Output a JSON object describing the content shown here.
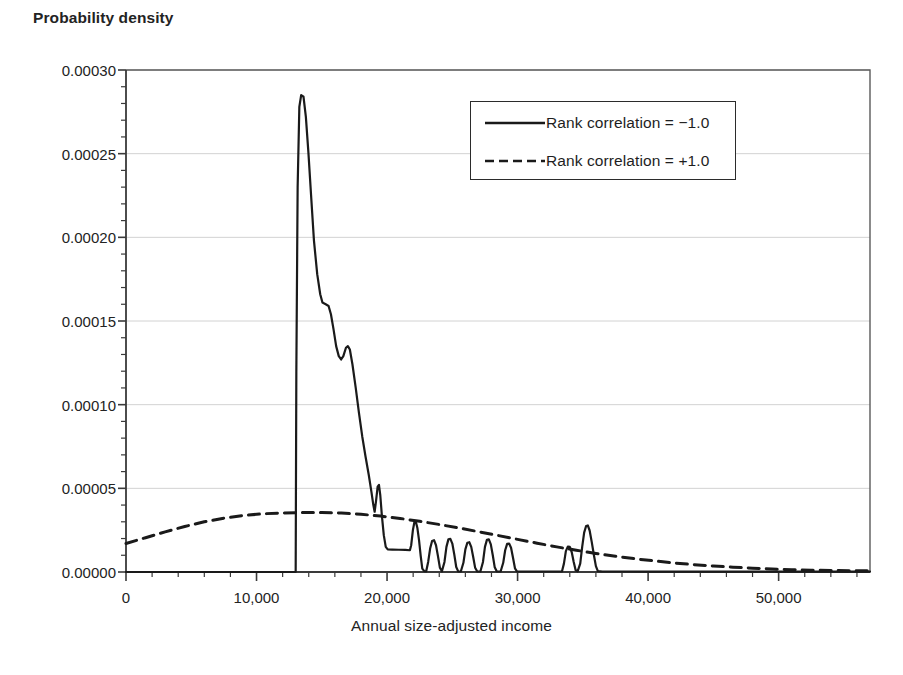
{
  "chart_data": {
    "type": "line",
    "title": "",
    "ylabel": "Probability density",
    "xlabel": "Annual size-adjusted income",
    "xlim": [
      0,
      57000
    ],
    "ylim": [
      0,
      0.0003
    ],
    "grid": "horizontal",
    "legend_position": "top-right",
    "x_ticks": [
      0,
      10000,
      20000,
      30000,
      40000,
      50000
    ],
    "x_tick_labels": [
      "0",
      "10,000",
      "20,000",
      "30,000",
      "40,000",
      "50,000"
    ],
    "x_minor_tick_step": 2000,
    "y_ticks": [
      0.0,
      5e-05,
      0.0001,
      0.00015,
      0.0002,
      0.00025,
      0.0003
    ],
    "y_tick_labels": [
      "0.00000",
      "0.00005",
      "0.00010",
      "0.00015",
      "0.00020",
      "0.00025",
      "0.00030"
    ],
    "y_minor_tick_step": 1e-05,
    "series": [
      {
        "name": "Rank correlation = −1.0",
        "style": "solid",
        "color": "#1a1a1a",
        "points": [
          [
            0,
            0.0
          ],
          [
            12900,
            0.0
          ],
          [
            13000,
            0.0
          ],
          [
            13050,
            0.00012
          ],
          [
            13150,
            0.00023
          ],
          [
            13280,
            0.000278
          ],
          [
            13420,
            0.000285
          ],
          [
            13600,
            0.000284
          ],
          [
            13780,
            0.000272
          ],
          [
            13980,
            0.00025
          ],
          [
            14180,
            0.000225
          ],
          [
            14400,
            0.000198
          ],
          [
            14650,
            0.000178
          ],
          [
            14880,
            0.000166
          ],
          [
            15050,
            0.000161
          ],
          [
            15300,
            0.00016
          ],
          [
            15520,
            0.000159
          ],
          [
            15700,
            0.000154
          ],
          [
            15900,
            0.000145
          ],
          [
            16100,
            0.000135
          ],
          [
            16300,
            0.000129
          ],
          [
            16480,
            0.000127
          ],
          [
            16650,
            0.000129
          ],
          [
            16850,
            0.000134
          ],
          [
            17000,
            0.000135
          ],
          [
            17150,
            0.000133
          ],
          [
            17350,
            0.000124
          ],
          [
            17600,
            0.00011
          ],
          [
            17850,
            9.5e-05
          ],
          [
            18100,
            8.1e-05
          ],
          [
            18350,
            6.9e-05
          ],
          [
            18600,
            5.8e-05
          ],
          [
            18800,
            4.8e-05
          ],
          [
            18950,
            4e-05
          ],
          [
            19050,
            3.6e-05
          ],
          [
            19150,
            4.2e-05
          ],
          [
            19280,
            5.1e-05
          ],
          [
            19380,
            5.2e-05
          ],
          [
            19480,
            4.6e-05
          ],
          [
            19600,
            3.4e-05
          ],
          [
            19750,
            2.2e-05
          ],
          [
            19900,
            1.5e-05
          ],
          [
            20050,
            1.35e-05
          ],
          [
            20400,
            1.34e-05
          ],
          [
            20900,
            1.33e-05
          ],
          [
            21400,
            1.32e-05
          ],
          [
            21750,
            1.3e-05
          ],
          [
            21850,
            1.6e-05
          ],
          [
            21980,
            2.5e-05
          ],
          [
            22100,
            3e-05
          ],
          [
            22200,
            3.02e-05
          ],
          [
            22320,
            2.65e-05
          ],
          [
            22450,
            1.9e-05
          ],
          [
            22580,
            9.5e-06
          ],
          [
            22700,
            2e-06
          ],
          [
            22850,
            5e-07
          ],
          [
            23000,
            4e-07
          ],
          [
            23150,
            6e-06
          ],
          [
            23300,
            1.4e-05
          ],
          [
            23450,
            1.85e-05
          ],
          [
            23600,
            1.9e-05
          ],
          [
            23750,
            1.6e-05
          ],
          [
            23900,
            9.5e-06
          ],
          [
            24050,
            2.5e-06
          ],
          [
            24200,
            4e-07
          ],
          [
            24400,
            6e-06
          ],
          [
            24550,
            1.5e-05
          ],
          [
            24700,
            1.95e-05
          ],
          [
            24850,
            1.98e-05
          ],
          [
            25000,
            1.7e-05
          ],
          [
            25150,
            1.05e-05
          ],
          [
            25300,
            3e-06
          ],
          [
            25450,
            4e-07
          ],
          [
            25650,
            3e-07
          ],
          [
            25850,
            5.5e-06
          ],
          [
            26000,
            1.35e-05
          ],
          [
            26150,
            1.75e-05
          ],
          [
            26300,
            1.78e-05
          ],
          [
            26450,
            1.5e-05
          ],
          [
            26600,
            9e-06
          ],
          [
            26750,
            2.5e-06
          ],
          [
            26900,
            4e-07
          ],
          [
            27150,
            3e-07
          ],
          [
            27350,
            6e-06
          ],
          [
            27500,
            1.5e-05
          ],
          [
            27650,
            1.92e-05
          ],
          [
            27800,
            1.95e-05
          ],
          [
            27950,
            1.65e-05
          ],
          [
            28100,
            1e-05
          ],
          [
            28250,
            2.8e-06
          ],
          [
            28400,
            4e-07
          ],
          [
            28700,
            3e-07
          ],
          [
            28900,
            5.5e-06
          ],
          [
            29050,
            1.3e-05
          ],
          [
            29200,
            1.68e-05
          ],
          [
            29350,
            1.7e-05
          ],
          [
            29500,
            1.45e-05
          ],
          [
            29650,
            8.5e-06
          ],
          [
            29800,
            2.2e-06
          ],
          [
            29950,
            4e-07
          ],
          [
            30200,
            3e-07
          ],
          [
            31000,
            3e-07
          ],
          [
            32000,
            3e-07
          ],
          [
            33000,
            3e-07
          ],
          [
            33400,
            3e-07
          ],
          [
            33550,
            5e-06
          ],
          [
            33700,
            1.25e-05
          ],
          [
            33850,
            1.52e-05
          ],
          [
            34000,
            1.5e-05
          ],
          [
            34150,
            1.18e-05
          ],
          [
            34300,
            6e-06
          ],
          [
            34450,
            1e-06
          ],
          [
            34600,
            4e-07
          ],
          [
            34800,
            5e-06
          ],
          [
            34950,
            1.5e-05
          ],
          [
            35100,
            2.35e-05
          ],
          [
            35250,
            2.75e-05
          ],
          [
            35380,
            2.78e-05
          ],
          [
            35520,
            2.48e-05
          ],
          [
            35680,
            1.8e-05
          ],
          [
            35850,
            1e-05
          ],
          [
            36000,
            3.5e-06
          ],
          [
            36150,
            5e-07
          ],
          [
            36500,
            3e-07
          ],
          [
            37500,
            3e-07
          ],
          [
            38000,
            3e-07
          ],
          [
            40000,
            2e-07
          ],
          [
            45000,
            2e-07
          ],
          [
            50000,
            2e-07
          ],
          [
            57000,
            2e-07
          ]
        ]
      },
      {
        "name": "Rank correlation = +1.0",
        "style": "dashed",
        "color": "#1a1a1a",
        "points": [
          [
            0,
            1.7e-05
          ],
          [
            1500,
            2.05e-05
          ],
          [
            3000,
            2.4e-05
          ],
          [
            4500,
            2.72e-05
          ],
          [
            6000,
            3e-05
          ],
          [
            7500,
            3.22e-05
          ],
          [
            9000,
            3.38e-05
          ],
          [
            10500,
            3.48e-05
          ],
          [
            12000,
            3.53e-05
          ],
          [
            13500,
            3.55e-05
          ],
          [
            15000,
            3.55e-05
          ],
          [
            16500,
            3.52e-05
          ],
          [
            18000,
            3.45e-05
          ],
          [
            19500,
            3.34e-05
          ],
          [
            21000,
            3.2e-05
          ],
          [
            22500,
            3.03e-05
          ],
          [
            24000,
            2.84e-05
          ],
          [
            25500,
            2.63e-05
          ],
          [
            27000,
            2.41e-05
          ],
          [
            28500,
            2.18e-05
          ],
          [
            30000,
            1.95e-05
          ],
          [
            31500,
            1.72e-05
          ],
          [
            33000,
            1.5e-05
          ],
          [
            34500,
            1.3e-05
          ],
          [
            36000,
            1.11e-05
          ],
          [
            37500,
            9.4e-06
          ],
          [
            39000,
            7.9e-06
          ],
          [
            40500,
            6.6e-06
          ],
          [
            42000,
            5.4e-06
          ],
          [
            43500,
            4.4e-06
          ],
          [
            45000,
            3.6e-06
          ],
          [
            46500,
            2.9e-06
          ],
          [
            48000,
            2.3e-06
          ],
          [
            49500,
            1.8e-06
          ],
          [
            51000,
            1.4e-06
          ],
          [
            52500,
            1.1e-06
          ],
          [
            54000,
            9e-07
          ],
          [
            55500,
            8e-07
          ],
          [
            57000,
            7e-07
          ]
        ]
      }
    ]
  },
  "legend": {
    "items": [
      {
        "label": "Rank correlation = −1.0",
        "style": "solid"
      },
      {
        "label": "Rank correlation = +1.0",
        "style": "dashed"
      }
    ]
  }
}
